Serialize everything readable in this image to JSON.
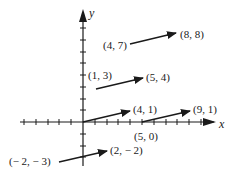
{
  "diagram": {
    "type": "vector-arrows-on-coordinate-plane",
    "axes": {
      "x_label": "x",
      "y_label": "y",
      "x_ticks": [
        -6,
        -5,
        -4,
        -3,
        -2,
        -1,
        1,
        2,
        3,
        4,
        5,
        6,
        7,
        8,
        9,
        10
      ],
      "y_ticks": [
        -3,
        -2,
        -1,
        1,
        2,
        3,
        4,
        5,
        6,
        7,
        8
      ]
    },
    "arrows": [
      {
        "from": [
          4,
          7
        ],
        "to": [
          8,
          8
        ],
        "from_label": "(4, 7)",
        "to_label": "(8, 8)"
      },
      {
        "from": [
          1,
          3
        ],
        "to": [
          5,
          4
        ],
        "from_label": "(1, 3)",
        "to_label": "(5, 4)"
      },
      {
        "from": [
          0,
          0
        ],
        "to": [
          4,
          1
        ],
        "from_label": "",
        "to_label": "(4, 1)"
      },
      {
        "from": [
          5,
          0
        ],
        "to": [
          9,
          1
        ],
        "from_label": "(5, 0)",
        "to_label": "(9, 1)"
      },
      {
        "from": [
          -2,
          -3
        ],
        "to": [
          2,
          -2
        ],
        "from_label": "(− 2, − 3)",
        "to_label": "(2, − 2)"
      }
    ],
    "colors": {
      "ink": "#1a1a1a",
      "background": "#ffffff"
    }
  }
}
